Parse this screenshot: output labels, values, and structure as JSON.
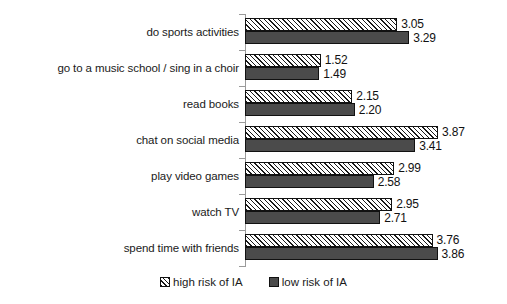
{
  "chart_data": {
    "type": "bar",
    "orientation": "horizontal",
    "title": "",
    "xlabel": "",
    "ylabel": "",
    "xlim": [
      0,
      4.2
    ],
    "grid": false,
    "legend_position": "bottom",
    "categories": [
      "do sports activities",
      "go to a music school / sing in a choir",
      "read books",
      "chat on social media",
      "play video games",
      "watch TV",
      "spend time with friends"
    ],
    "series": [
      {
        "name": "high risk of IA",
        "pattern": "diagonal-hatch",
        "color": "#ffffff",
        "values": [
          3.05,
          1.52,
          2.15,
          3.87,
          2.99,
          2.95,
          3.76
        ]
      },
      {
        "name": "low risk of IA",
        "pattern": "solid",
        "color": "#4b4b4b",
        "values": [
          3.29,
          1.49,
          2.2,
          3.41,
          2.58,
          2.71,
          3.86
        ]
      }
    ],
    "value_labels": {
      "high": [
        "3.05",
        "1.52",
        "2.15",
        "3.87",
        "2.99",
        "2.95",
        "3.76"
      ],
      "low": [
        "3.29",
        "1.49",
        "2.20",
        "3.41",
        "2.58",
        "2.71",
        "3.86"
      ]
    }
  },
  "legend": {
    "entries": [
      {
        "label": "high risk of IA",
        "swatch": "hatched-square-icon"
      },
      {
        "label": "low risk of IA",
        "swatch": "filled-square-icon"
      }
    ]
  }
}
